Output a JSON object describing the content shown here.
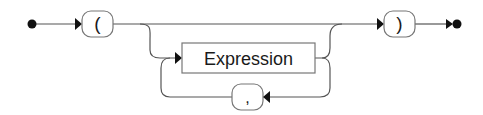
{
  "diagram": {
    "type": "railroad-syntax-diagram",
    "line_color": "#555555",
    "box_stroke": "#777777",
    "fill_color": "#111111",
    "nodes": {
      "open_paren": {
        "label": "(",
        "kind": "terminal"
      },
      "expression": {
        "label": "Expression",
        "kind": "nonterminal"
      },
      "comma": {
        "label": ",",
        "kind": "terminal"
      },
      "close_paren": {
        "label": ")",
        "kind": "terminal"
      }
    },
    "paths": [
      "start -> ( ",
      "( -> ) (skip, empty list)",
      "( -> Expression -> )",
      "Expression -> , -> Expression (repeat)",
      ") -> end"
    ]
  }
}
